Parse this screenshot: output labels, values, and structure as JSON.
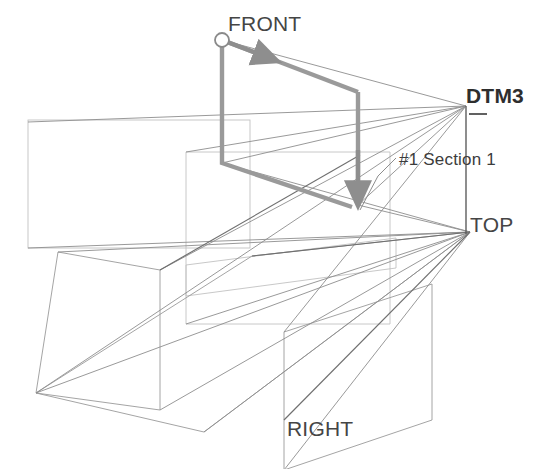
{
  "diagram": {
    "labels": {
      "front": "FRONT",
      "top": "TOP",
      "right": "RIGHT",
      "datum": "DTM3",
      "section": "#1 Section 1"
    },
    "colors": {
      "background": "#ffffff",
      "thin_line": "#8d8d8d",
      "faint_line": "#b9b9b9",
      "medium_line": "#6f6f6f",
      "highlight_path": "#9a9a9a",
      "text": "#3a3a3a",
      "text_bold": "#2e2e2e"
    },
    "geometry": {
      "start_marker": {
        "cx": 222,
        "cy": 40,
        "r": 7
      },
      "vanishing_points": {
        "datum_dtm3": {
          "x": 466,
          "y": 106
        },
        "top": {
          "x": 470,
          "y": 232
        }
      },
      "highlight_path_points": "222,40 358,92 358,205",
      "highlight_path_points_2": "222,40 222,163 358,205",
      "front_plane_rect": {
        "x": 28,
        "y": 120,
        "w": 222,
        "h": 128
      },
      "inner_plane_rect": {
        "x": 186,
        "y": 152,
        "w": 204,
        "h": 172
      }
    }
  }
}
